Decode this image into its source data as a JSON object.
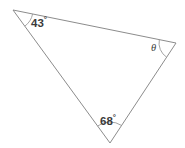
{
  "figure": {
    "type": "triangle-angle-diagram",
    "background_color": "#ffffff",
    "stroke_color": "#8c8c8c",
    "stroke_width": 1,
    "text_color": "#3b3b3b",
    "width": 185,
    "height": 148
  },
  "vertices": [
    {
      "id": "A",
      "name": "top-left-vertex",
      "x": 13,
      "y": 10
    },
    {
      "id": "B",
      "name": "right-vertex",
      "x": 176,
      "y": 43
    },
    {
      "id": "C",
      "name": "bottom-vertex",
      "x": 110,
      "y": 143
    }
  ],
  "edges": [
    {
      "name": "top-edge",
      "from": "A",
      "to": "B"
    },
    {
      "name": "right-edge",
      "from": "B",
      "to": "C"
    },
    {
      "name": "left-edge",
      "from": "C",
      "to": "A"
    }
  ],
  "angles": [
    {
      "id": "A",
      "name": "angle-43",
      "vertex": "top-left-vertex",
      "value": "43",
      "unit": "°",
      "label": "43°",
      "has_arc": true,
      "arc_radius": 20
    },
    {
      "id": "B",
      "name": "angle-theta",
      "vertex": "right-vertex",
      "value": "θ",
      "unit": "",
      "label": "θ",
      "has_arc": true,
      "arc_radius": 17
    },
    {
      "id": "C",
      "name": "angle-68",
      "vertex": "bottom-vertex",
      "value": "68",
      "unit": "°",
      "label": "68°",
      "has_arc": true,
      "arc_radius": 21
    }
  ],
  "labels": {
    "angle_a_value": "43",
    "angle_a_degree": "°",
    "angle_b_value": "θ",
    "angle_c_value": "68",
    "angle_c_degree": "°"
  }
}
